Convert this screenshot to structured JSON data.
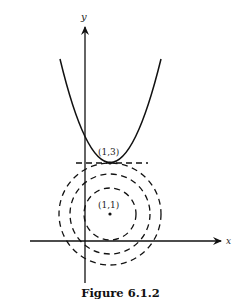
{
  "figure": {
    "caption": "Figure 6.1.2",
    "axes": {
      "x_label": "x",
      "y_label": "y"
    },
    "points": [
      {
        "label": "(1,3)",
        "x": 1,
        "y": 3
      },
      {
        "label": "(1,1)",
        "x": 1,
        "y": 1
      }
    ],
    "curves": {
      "parabola": "upward parabola with vertex (1,3)",
      "tangent_line": "dashed horizontal line y = 3",
      "level_circles": "three dashed concentric circles centered at (1,1)"
    },
    "colors": {
      "ink": "#111111",
      "background": "#ffffff"
    }
  }
}
